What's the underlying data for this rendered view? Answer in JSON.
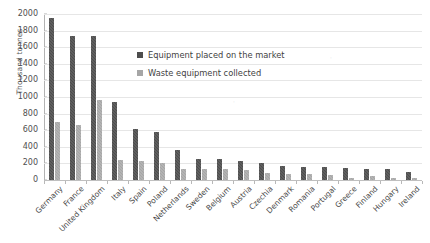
{
  "chart_data": {
    "type": "bar",
    "title": "",
    "xlabel": "",
    "ylabel": "Thousand tonnes",
    "ylim": [
      0,
      2000
    ],
    "ytick_step": 200,
    "grid": true,
    "legend_position": "inside-upper-center",
    "categories": [
      "Germany",
      "France",
      "United Kingdom",
      "Italy",
      "Spain",
      "Poland",
      "Netherlands",
      "Sweden",
      "Belgium",
      "Austria",
      "Czechia",
      "Denmark",
      "Romania",
      "Portugal",
      "Greece",
      "Finland",
      "Hungary",
      "Ireland"
    ],
    "series": [
      {
        "name": "Equipment placed on the market",
        "color": "#4d4d4d",
        "values": [
          1950,
          1740,
          1730,
          940,
          620,
          575,
          365,
          258,
          250,
          235,
          200,
          170,
          160,
          158,
          150,
          135,
          128,
          95
        ]
      },
      {
        "name": "Waste equipment collected",
        "color": "#a6a6a6",
        "values": [
          700,
          660,
          960,
          245,
          225,
          210,
          135,
          130,
          130,
          118,
          80,
          78,
          70,
          62,
          30,
          48,
          30,
          28
        ]
      }
    ],
    "yticks": [
      "0",
      "200",
      "400",
      "600",
      "800",
      "1000",
      "1200",
      "1400",
      "1600",
      "1800",
      "2000"
    ]
  },
  "legend": {
    "items": [
      {
        "label": "Equipment placed on the market",
        "swatch": "market"
      },
      {
        "label": "Waste equipment collected",
        "swatch": "collected"
      }
    ]
  },
  "axis": {
    "y_title": "Thousand tonnes"
  }
}
